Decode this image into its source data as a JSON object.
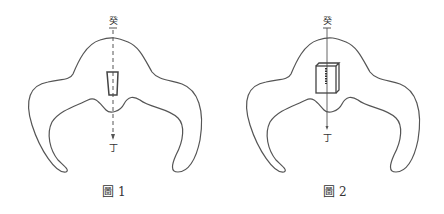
{
  "figures": [
    {
      "caption": "圖 1",
      "top_label": "癸",
      "bottom_label": "丁",
      "axis_style": "dashed-arrow",
      "marker": "tapered-block"
    },
    {
      "caption": "圖 2",
      "top_label": "癸",
      "bottom_label": "丁",
      "axis_style": "solid-line",
      "marker": "3d-box"
    }
  ],
  "colors": {
    "stroke": "#555555",
    "text": "#333333",
    "background": "#ffffff"
  }
}
